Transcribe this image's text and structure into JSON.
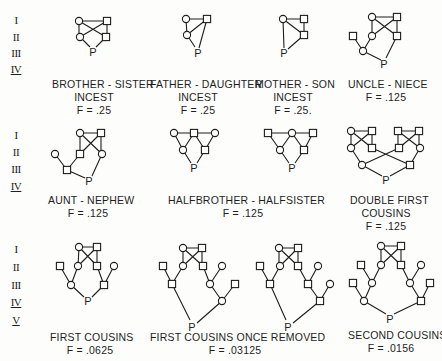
{
  "figure": {
    "generation_labels": [
      "I",
      "II",
      "III",
      "IV",
      "V"
    ],
    "rows": [
      {
        "generations": [
          "I",
          "II",
          "III",
          "IV"
        ],
        "panels": [
          {
            "id": "brother-sister",
            "title_lines": [
              "BROTHER - SISTER",
              "INCEST"
            ],
            "f_label": "F = .25"
          },
          {
            "id": "father-daughter",
            "title_lines": [
              "FATHER - DAUGHTER",
              "INCEST"
            ],
            "f_label": "F = .25"
          },
          {
            "id": "mother-son",
            "title_lines": [
              "MOTHER - SON",
              "INCEST"
            ],
            "f_label": "F = .25."
          },
          {
            "id": "uncle-niece",
            "title_lines": [
              "UNCLE - NIECE"
            ],
            "f_label": "F = .125"
          }
        ]
      },
      {
        "generations": [
          "I",
          "II",
          "III",
          "IV"
        ],
        "panels": [
          {
            "id": "aunt-nephew",
            "title_lines": [
              "AUNT - NEPHEW"
            ],
            "f_label": "F = .125"
          },
          {
            "id": "halfbrother-halfsister",
            "title_lines": [
              "HALFBROTHER - HALFSISTER"
            ],
            "f_label": "F = .125"
          },
          {
            "id": "double-first-cousins",
            "title_lines": [
              "DOUBLE FIRST",
              "COUSINS"
            ],
            "f_label": "F = .125"
          }
        ]
      },
      {
        "generations": [
          "I",
          "II",
          "III",
          "IV",
          "V"
        ],
        "panels": [
          {
            "id": "first-cousins",
            "title_lines": [
              "FIRST COUSINS"
            ],
            "f_label": "F = .0625"
          },
          {
            "id": "first-cousins-once-removed",
            "title_lines": [
              "FIRST COUSINS ONCE REMOVED"
            ],
            "f_label": "F = .03125"
          },
          {
            "id": "second-cousins",
            "title_lines": [
              "SECOND COUSINS"
            ],
            "f_label": "F = .0156"
          }
        ]
      }
    ],
    "proband_label": "P",
    "legend_symbols": {
      "circle": "female",
      "square": "male"
    },
    "ink_color": "#1e1e1e"
  }
}
